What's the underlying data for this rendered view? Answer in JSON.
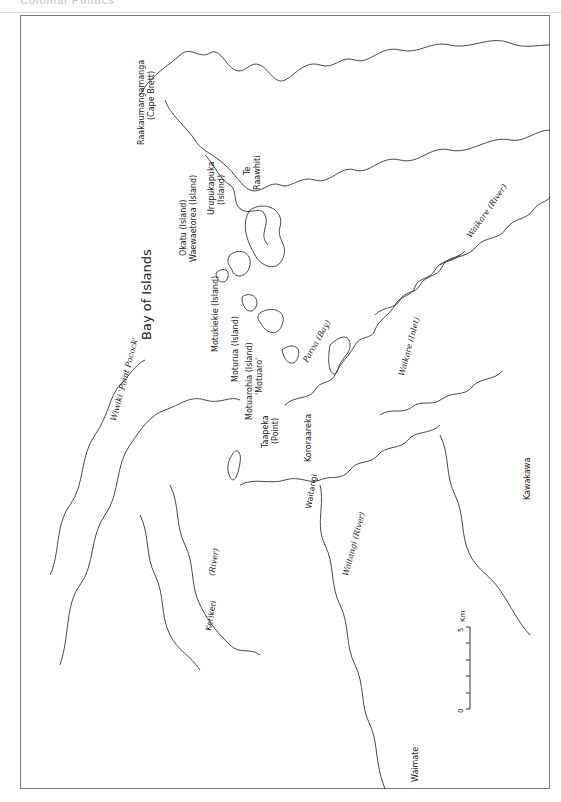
{
  "header": {
    "text": "Colonial Politics"
  },
  "map": {
    "title_label": "Bay of Islands",
    "labels": {
      "raakaumangamanga": "Raakaumangamanga",
      "cape_brett": "(Cape Brett)",
      "te": "Te",
      "raawhiti": "Raawhiti",
      "okatu": "Okatu (Island)",
      "waewaetorea": "Waewaetorea (Island)",
      "urupukapuka": "Urupukapuka",
      "urupukapuka_island": "(Island)",
      "motukiekie": "Motukiekie (Island)",
      "moturua": "Moturua (Island)",
      "motuarohia": "Motuarohia (Island)",
      "motuaro": "'Motuaro'",
      "taapeka": "Taapeka",
      "taapeka_point": "(Point)",
      "paroa_bay": "Paroa (Bay)",
      "kororaareka": "Kororaareka",
      "waitangi": "Waitangi",
      "waitangi_river": "Waitangi (River)",
      "waikare_inlet": "Waikare (Inlet)",
      "waikare_river": "Waikare (River)",
      "kawakawa": "Kawakawa",
      "kerikeri": "Kerikeri",
      "kerikeri_river": "(River)",
      "wiwiki": "Wiwiki 'Point Pocock'",
      "waimate": "Waimate"
    },
    "scale": {
      "zero": "0",
      "five": "5",
      "unit": "Km",
      "ticks": 5
    },
    "colors": {
      "line": "#333333",
      "frame": "#777777",
      "header": "#bdbdbd"
    }
  }
}
